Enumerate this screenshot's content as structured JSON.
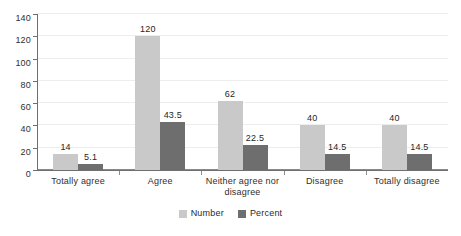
{
  "chart_data": {
    "type": "bar",
    "title": "",
    "subtitle": "",
    "xlabel": "",
    "ylabel": "",
    "ylim": [
      0,
      140
    ],
    "ytick_step": 20,
    "yticks": [
      "0",
      "20",
      "40",
      "60",
      "80",
      "100",
      "120",
      "140"
    ],
    "grid": true,
    "legend_position": "bottom-center",
    "categories": [
      "Totally agree",
      "Agree",
      "Neither agree nor disagree",
      "Disagree",
      "Totally disagree"
    ],
    "series": [
      {
        "name": "Number",
        "color": "#c9c9c9",
        "values": [
          14,
          120,
          62,
          40,
          40
        ],
        "labels": [
          "14",
          "120",
          "62",
          "40",
          "40"
        ]
      },
      {
        "name": "Percent",
        "color": "#6e6e6e",
        "values": [
          5.1,
          43.5,
          22.5,
          14.5,
          14.5
        ],
        "labels": [
          "5.1",
          "43.5",
          "22.5",
          "14.5",
          "14.5"
        ]
      }
    ]
  },
  "legend": {
    "items": [
      {
        "label": "Number",
        "swatch": "number"
      },
      {
        "label": "Percent",
        "swatch": "percent"
      }
    ]
  },
  "colors": {
    "series_number": "#c9c9c9",
    "series_percent": "#6e6e6e",
    "gridline": "#ededed",
    "axis": "#6f6f6f",
    "text": "#2b2b2b",
    "background": "#ffffff"
  }
}
